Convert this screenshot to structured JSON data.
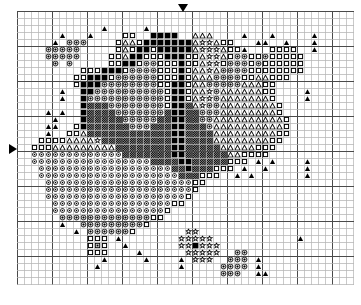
{
  "chart_data": {
    "type": "heatmap",
    "xlabel": "",
    "ylabel": "",
    "grid": true,
    "grid_minor_color": "#b4b4b4",
    "grid_major_color": "#4a4a4a",
    "grid_major_every": 5,
    "cell_size_px": 7,
    "columns": 48,
    "rows": 39,
    "xlim": [
      0,
      48
    ],
    "ylim": [
      0,
      39
    ],
    "background_color": "#ffffff",
    "symbol_color": "#000000",
    "legend": [
      {
        "key": "T",
        "name": "filled-triangle",
        "glyph": "solid triangle"
      },
      {
        "key": "t",
        "name": "open-triangle",
        "glyph": "outline triangle"
      },
      {
        "key": "O",
        "name": "circle-dot",
        "glyph": "circle with center dot"
      },
      {
        "key": "o",
        "name": "open-circle",
        "glyph": "small open circle"
      },
      {
        "key": "S",
        "name": "star",
        "glyph": "open star"
      },
      {
        "key": "Q",
        "name": "open-square",
        "glyph": "outline square"
      },
      {
        "key": "B",
        "name": "filled-square",
        "glyph": "solid square"
      },
      {
        "key": "X",
        "name": "cross-hatch",
        "glyph": "dense cross hatch"
      },
      {
        "key": "D",
        "name": "dot-square",
        "glyph": "square with center dot"
      },
      {
        "key": ".",
        "name": "empty",
        "glyph": "blank fabric"
      }
    ],
    "markers": [
      {
        "name": "top-center-arrow",
        "edge": "top",
        "column": 23,
        "direction": "down"
      },
      {
        "name": "left-center-arrow",
        "edge": "left",
        "row": 19,
        "direction": "right"
      }
    ],
    "cells": [
      "................................................",
      "................................................",
      "............T.....T.............................",
      "......T...T....QQ..BBBB..ttt....T...T.....T.....",
      ".....T.OOO....QttQBBBBBBBtSStQQ...TT..T...T.....",
      "....OOOOO.....QtQBBQBBBBBtSSStQQT...QQQQ..T.....",
      "....OOOOO....QQtBBQQQBBBQQtSStQOOQQOQQQQQ.......",
      ".....O.O.....QQBBQOOQQQBQQtSSQOOOQOQQQQQQ.......",
      ".........QQQBBBQOOOOQQQBQttStOOOOQQQQQQQQ.......",
      "........QQBBBQOOOOOOQQQBQtttOOOOQQttQQQ.........",
      "........QBBBOOOOOOOOQQBBQttOOOOOtttQQ...........",
      "......T..BBOOOOOOOOOOQBBQttSOttttttQQ....T......",
      "......T..BOOOOOOOOOOOQBBQtSSOtttttttQ....T......",
      ".........BXXXOOOOOOOOQBBXtSOOttttttttQ..........",
      "....T.T..BXXXXOOOOOOOXBBXXOOOttttttttQ..........",
      ".....T...BXXXXXOOOOOXXBBXXOOttttttttttQ.........",
      "....TT..QBXXXXXXOOOXXXBBXXXOttttttttttQ.........",
      "....T..QQtXXXXXXXXXXXXBBXXXXtttttttttQQ.........",
      "...QQQQttttSXXXXXXXXXXBBXXXXttttttttQQ..........",
      "..QQQtttttttttXXXXXXXXBBXXXXXtttttQQQ...........",
      "..oooooooooooooXXXXXXXBBXXXXXXttQQQQ............",
      "..oooooooooooooooooXXXXBBXXXXXQQQ.T.T....T......",
      "...oooooooooooooooooooXXBXXXQQQ.T..T.....T......",
      "...ooooooooooooooooooooXXXQQQ..T.T.......T......",
      "....oooooooooooooooooooooQQ.....................",
      "....oooooooooooooooooooooQ......................",
      "....ooooooooooooooooooooQ.......................",
      ".....oooooooooooooooooQQ........................",
      ".....ooooooooooooooooQ..........................",
      "......OOOOOOOOOOOOOQQ...........................",
      "......T..OOOOOOOOOQ.............................",
      "........T.OOOOOOQ.......SS......................",
      "..........QQQ.T........SSSSS............T.......",
      "..........QDQ..T.......SSBSSS...................",
      "..........QQQ....T......SSSSS..OO...............",
      "............T.....T....T.SSS..OOO.T.............",
      "...........T...........T.....OOOO.T.............",
      ".............................OOO..TT............",
      "................................................"
    ]
  },
  "markers_labels": {
    "top_arrow_name": "top-center-arrow",
    "left_arrow_name": "left-center-arrow"
  }
}
